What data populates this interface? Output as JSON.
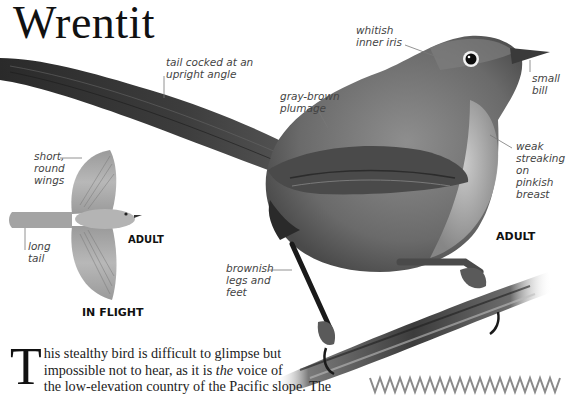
{
  "page": {
    "title": "Wrentit"
  },
  "annotations": {
    "iris": [
      "whitish",
      "inner iris"
    ],
    "tail": [
      "tail cocked at an",
      "upright angle"
    ],
    "bill": [
      "small",
      "bill"
    ],
    "plumage": [
      "gray-brown",
      "plumage"
    ],
    "breast": [
      "weak",
      "streaking",
      "on pinkish",
      "breast"
    ],
    "wings": [
      "short,",
      "round",
      "wings"
    ],
    "long_tail": [
      "long",
      "tail"
    ],
    "legs": [
      "brownish",
      "legs and",
      "feet"
    ]
  },
  "labels": {
    "flight_age": "ADULT",
    "flight_caption": "IN FLIGHT",
    "main_age": "ADULT"
  },
  "body_text": {
    "dropcap": "T",
    "line1": "his stealthy bird is difficult to glimpse but",
    "line2_pre": "impossible not to hear, as it is ",
    "line2_em": "the",
    "line2_post": " voice of",
    "line3": "the low-elevation country of the Pacific slope. The"
  },
  "colors": {
    "ink": "#111111",
    "annotation": "#444444",
    "leader": "#777777",
    "zigzag": "#8a8a8a"
  }
}
